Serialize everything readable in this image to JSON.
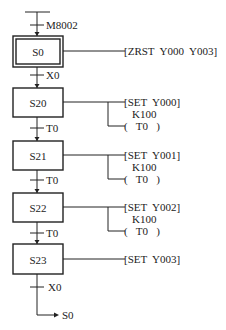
{
  "diagram": {
    "type": "sfc-step-ladder",
    "initial_transition": "M8002",
    "steps": [
      {
        "id": "S0",
        "initial": true,
        "actions": [
          "[ZRST  Y000  Y003]"
        ],
        "timer": null,
        "next_transition": "X0"
      },
      {
        "id": "S20",
        "initial": false,
        "actions": [
          "[SET  Y000]"
        ],
        "timer": {
          "preset": "K100",
          "coil": "(   T0   )"
        },
        "next_transition": "T0"
      },
      {
        "id": "S21",
        "initial": false,
        "actions": [
          "[SET  Y001]"
        ],
        "timer": {
          "preset": "K100",
          "coil": "(   T0   )"
        },
        "next_transition": "T0"
      },
      {
        "id": "S22",
        "initial": false,
        "actions": [
          "[SET  Y002]"
        ],
        "timer": {
          "preset": "K100",
          "coil": "(   T0   )"
        },
        "next_transition": "T0"
      },
      {
        "id": "S23",
        "initial": false,
        "actions": [
          "[SET  Y003]"
        ],
        "timer": null,
        "next_transition": "X0"
      }
    ],
    "jump_target": "S0"
  }
}
